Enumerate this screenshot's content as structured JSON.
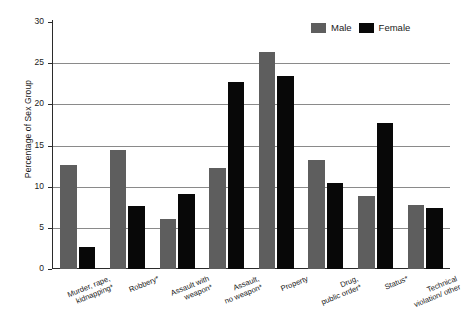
{
  "chart_data": {
    "type": "bar",
    "title": "",
    "xlabel": "",
    "ylabel": "Percentage of Sex Group",
    "ylim": [
      0,
      30
    ],
    "ytick_values": [
      0,
      5,
      10,
      15,
      20,
      25,
      30
    ],
    "ytick_labels": [
      "0",
      "5",
      "10",
      "15",
      "20",
      "25",
      "30"
    ],
    "grid": true,
    "grid_axis": "y",
    "legend_position": "top-right",
    "categories": [
      "Murder, rape,\nkidnapping*",
      "Robbery*",
      "Assault with\nweapon*",
      "Assault,\nno weapon*",
      "Property",
      "Drug,\npublic order*",
      "Status*",
      "Technical\nviolation/ other"
    ],
    "series": [
      {
        "name": "Male",
        "color": "#5e5e5e",
        "values": [
          12.6,
          14.4,
          6.1,
          12.3,
          26.3,
          13.3,
          8.9,
          7.8
        ]
      },
      {
        "name": "Female",
        "color": "#080808",
        "values": [
          2.7,
          7.6,
          9.1,
          22.7,
          23.4,
          10.5,
          17.7,
          7.4
        ]
      }
    ]
  },
  "legend": {
    "items": [
      {
        "label": "Male"
      },
      {
        "label": "Female"
      }
    ]
  },
  "colors": {
    "male": "#5e5e5e",
    "female": "#080808",
    "gridline": "#8a8a8a",
    "axis": "#2b2b2b",
    "background": "#ffffff"
  }
}
